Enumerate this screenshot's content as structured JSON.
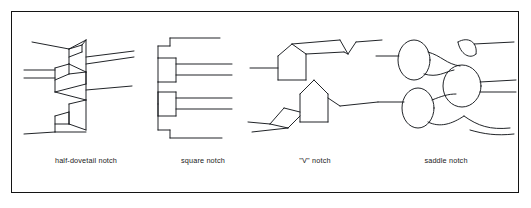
{
  "figure": {
    "border_color": "#141414",
    "line_color": "#15181c",
    "background": "#ffffff",
    "panel_count": 4
  },
  "panels": [
    {
      "id": "half-dovetail-notch",
      "caption": "half-dovetail notch",
      "description": "Vertical corner post shown with angled half-dovetail seats; four horizontal log members enter from the left and right at alternating heights.",
      "notch_shape": "angled wedge (half dovetail)",
      "log_ends": 4
    },
    {
      "id": "square-notch",
      "caption": "square notch",
      "description": "Vertical post with two rectangular square-cut notches; pairs of parallel log lines project to the right from each notch, with stepped log ends at top and bottom.",
      "notch_shape": "rectangular",
      "log_ends": 4
    },
    {
      "id": "vee-notch",
      "caption": "\"V\" notch",
      "description": "Interlocking logs cut with peaked V-shaped ends; upper log peak seats into the lower log saddle, with log members running left and right.",
      "notch_shape": "peaked V",
      "log_ends": 4
    },
    {
      "id": "saddle-notch",
      "caption": "saddle notch",
      "description": "Round log ends drawn as ellipses with concave saddle cuts where the crossing logs seat together; four round logs interlock at the corner.",
      "notch_shape": "rounded saddle (concave)",
      "log_ends": 4
    }
  ]
}
